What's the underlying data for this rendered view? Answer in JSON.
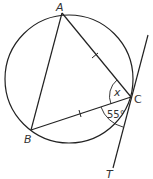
{
  "diagram": {
    "type": "circle-geometry",
    "colors": {
      "stroke": "#222222",
      "text": "#333333",
      "background": "#ffffff"
    },
    "circle": {
      "cx": 69,
      "cy": 79,
      "r": 64
    },
    "points": {
      "A": {
        "label": "A",
        "x": 62,
        "y": 13
      },
      "B": {
        "label": "B",
        "x": 31,
        "y": 130
      },
      "C": {
        "label": "C",
        "x": 131,
        "y": 97
      },
      "T": {
        "label": "T"
      }
    },
    "segments": [
      "AB",
      "AC",
      "BC"
    ],
    "tangent": {
      "through": "C",
      "end_label": "T"
    },
    "equal_marks": [
      "AC",
      "BC"
    ],
    "angles": {
      "acb": {
        "label": "x",
        "vertex": "C",
        "between": [
          "CA",
          "CB"
        ]
      },
      "bct": {
        "label": "55°",
        "vertex": "C",
        "between": [
          "CB",
          "CT"
        ]
      }
    }
  }
}
